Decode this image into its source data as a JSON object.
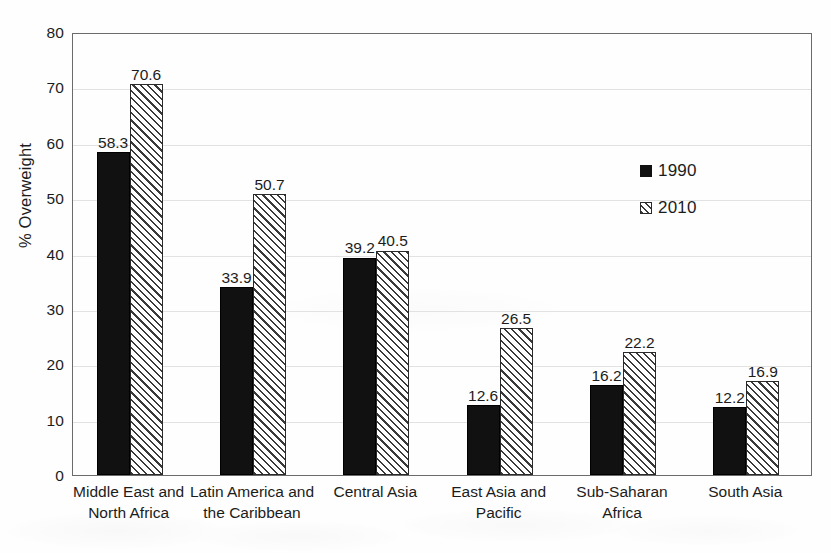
{
  "chart_data": {
    "type": "bar",
    "title": "",
    "xlabel": "",
    "ylabel": "% Overweight",
    "ylim": [
      0,
      80
    ],
    "ytick_step": 10,
    "yticks": [
      "80",
      "70",
      "60",
      "50",
      "40",
      "30",
      "20",
      "10",
      "0"
    ],
    "grid": true,
    "legend_position": "inside-right",
    "categories": [
      "Middle East and North Africa",
      "Latin America and the Caribbean",
      "Central Asia",
      "East Asia and Pacific",
      "Sub-Saharan Africa",
      "South Asia"
    ],
    "category_lines": [
      [
        "Middle East and",
        "North Africa"
      ],
      [
        "Latin America and",
        "the Caribbean"
      ],
      [
        "Central Asia",
        ""
      ],
      [
        "East Asia and",
        "Pacific"
      ],
      [
        "Sub-Saharan",
        "Africa"
      ],
      [
        "South Asia",
        ""
      ]
    ],
    "series": [
      {
        "name": "1990",
        "style": "solid-black",
        "color": "#111111",
        "values": [
          58.3,
          33.9,
          39.2,
          12.6,
          16.2,
          12.2
        ],
        "labels": [
          "58.3",
          "33.9",
          "39.2",
          "12.6",
          "16.2",
          "12.2"
        ]
      },
      {
        "name": "2010",
        "style": "diagonal-hatch",
        "color": "#3a3a3a",
        "values": [
          70.6,
          50.7,
          40.5,
          26.5,
          22.2,
          16.9
        ],
        "labels": [
          "70.6",
          "50.7",
          "40.5",
          "26.5",
          "22.2",
          "16.9"
        ]
      }
    ]
  },
  "legend": {
    "items": [
      {
        "label": "1990",
        "swatch": "solid-square-icon"
      },
      {
        "label": "2010",
        "swatch": "hatched-square-icon"
      }
    ]
  },
  "colors": {
    "series_1990": "#111111",
    "series_2010_hatch": "#3a3a3a",
    "axis": "#6b6b6b",
    "grid": "#e2e2e2",
    "text": "#1c1c1c",
    "background": "#ffffff"
  }
}
